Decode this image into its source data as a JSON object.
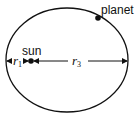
{
  "diagram": {
    "labels": {
      "planet": "planet",
      "sun": "sun",
      "r1": "r",
      "r1_sub": "1",
      "r3": "r",
      "r3_sub": "3"
    },
    "colors": {
      "stroke": "#111111",
      "background": "#ffffff"
    }
  }
}
